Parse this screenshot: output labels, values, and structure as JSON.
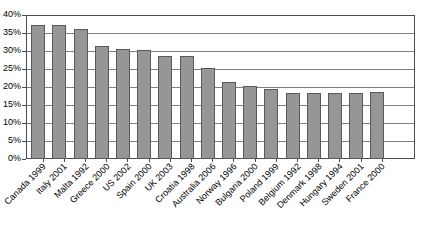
{
  "chart_data": {
    "type": "bar",
    "title": "",
    "subtitle": "",
    "xlabel": "",
    "ylabel": "",
    "categories": [
      "Canada 1999",
      "Italy 2001",
      "Malta 1992",
      "Greece 2000",
      "US 2002",
      "Spain 2000",
      "UK 2003",
      "Croatia 1998",
      "Australia 2006",
      "Norway 1996",
      "Bulgaria 2000",
      "Poland 1999",
      "Belgium 1992",
      "Denmark 1998",
      "Hungary 1994",
      "Sweden 2001",
      "France 2000"
    ],
    "values": [
      37.3,
      37.1,
      36.2,
      31.4,
      30.5,
      30.4,
      28.5,
      28.5,
      25.3,
      21.3,
      20.4,
      19.4,
      18.3,
      18.2,
      18.2,
      18.3,
      18.5
    ],
    "ylim": [
      0,
      40
    ],
    "ytick_values": [
      0,
      5,
      10,
      15,
      20,
      25,
      30,
      35,
      40
    ],
    "ytick_labels": [
      "0%",
      "5%",
      "10%",
      "15%",
      "20%",
      "25%",
      "30%",
      "35%",
      "40%"
    ],
    "grid": true,
    "grid_axis": "y",
    "legend": false,
    "legend_position": "none",
    "bar_color": "#969696",
    "bar_border_color": "#5a5a5a",
    "axis_color": "#4c4c4c",
    "gridline_color": "#808080",
    "background_color": "#ffffff"
  }
}
